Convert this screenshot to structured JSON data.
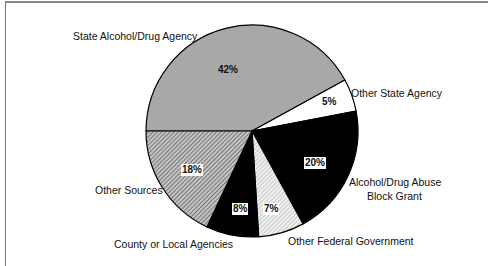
{
  "chart_data": {
    "type": "pie",
    "title": "",
    "start_angle_deg": 180,
    "direction": "clockwise",
    "slices": [
      {
        "label": "State Alcohol/Drug Agency",
        "value": 42,
        "display": "42%",
        "fill": "#a8a8a8",
        "pattern": "solid-gray"
      },
      {
        "label": "Other State Agency",
        "value": 5,
        "display": "5%",
        "fill": "#ffffff",
        "pattern": "solid-white"
      },
      {
        "label": "Alcohol/Drug Abuse Block Grant",
        "value": 20,
        "display": "20%",
        "fill": "#000000",
        "pattern": "solid-black"
      },
      {
        "label": "Other Federal Government",
        "value": 7,
        "display": "7%",
        "fill": "#d8d8d8",
        "pattern": "light-dots"
      },
      {
        "label": "County or Local Agencies",
        "value": 8,
        "display": "8%",
        "fill": "#000000",
        "pattern": "solid-black"
      },
      {
        "label": "Other Sources",
        "value": 18,
        "display": "18%",
        "fill": "#9a9a9a",
        "pattern": "diagonal-hatch"
      }
    ],
    "legend": "none (direct labels)"
  },
  "labels": {
    "state_agency": "State Alcohol/Drug Agency",
    "other_state": "Other State Agency",
    "block_grant_line1": "Alcohol/Drug Abuse",
    "block_grant_line2": "Block Grant",
    "other_federal": "Other Federal Government",
    "county_local": "County or Local Agencies",
    "other_sources": "Other Sources"
  },
  "percents": {
    "state_agency": "42%",
    "other_state": "5%",
    "block_grant": "20%",
    "other_federal": "7%",
    "county_local": "8%",
    "other_sources": "18%"
  }
}
